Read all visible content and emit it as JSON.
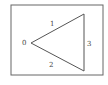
{
  "diagram": {
    "frame": {
      "x": 11,
      "y": 5,
      "width": 92,
      "height": 70,
      "stroke": "#666666"
    },
    "triangle": {
      "vertices": [
        [
          31,
          43
        ],
        [
          84,
          14
        ],
        [
          84,
          71
        ]
      ],
      "stroke": "#555555"
    },
    "labels": [
      {
        "text": "0",
        "x": 22,
        "y": 45
      },
      {
        "text": "1",
        "x": 50,
        "y": 26
      },
      {
        "text": "3",
        "x": 87,
        "y": 46
      },
      {
        "text": "2",
        "x": 49,
        "y": 67
      }
    ]
  }
}
